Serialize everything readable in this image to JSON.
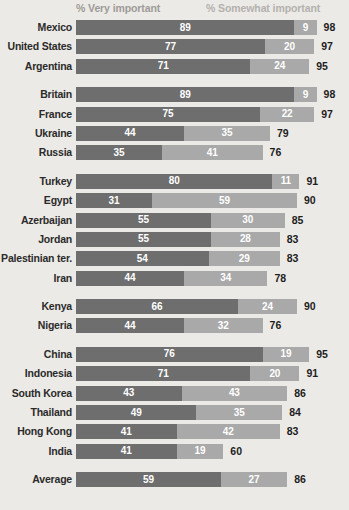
{
  "legend": {
    "very_label": "% Very important",
    "somewhat_label": "% Somewhat important"
  },
  "chart_data": {
    "type": "bar",
    "title": "",
    "subtitle": "",
    "xlabel": "",
    "ylabel": "",
    "orientation": "horizontal",
    "stacked": true,
    "grid": false,
    "legend_position": "top",
    "xlim": [
      0,
      100
    ],
    "categories": [
      "Mexico",
      "United States",
      "Argentina",
      "Britain",
      "France",
      "Ukraine",
      "Russia",
      "Turkey",
      "Egypt",
      "Azerbaijan",
      "Jordan",
      "Palestinian ter.",
      "Iran",
      "Kenya",
      "Nigeria",
      "China",
      "Indonesia",
      "South Korea",
      "Thailand",
      "Hong Kong",
      "India",
      "Average"
    ],
    "series": [
      {
        "name": "% Very important",
        "color": "#6e6e6e",
        "values": [
          89,
          77,
          71,
          89,
          75,
          44,
          35,
          80,
          31,
          55,
          55,
          54,
          44,
          66,
          44,
          76,
          71,
          43,
          49,
          41,
          41,
          59
        ]
      },
      {
        "name": "% Somewhat important",
        "color": "#a9a9a9",
        "values": [
          9,
          20,
          24,
          9,
          22,
          35,
          41,
          11,
          59,
          30,
          28,
          29,
          34,
          24,
          32,
          19,
          20,
          43,
          35,
          42,
          19,
          27
        ]
      }
    ],
    "totals": [
      98,
      97,
      95,
      98,
      97,
      79,
      76,
      91,
      90,
      85,
      83,
      83,
      78,
      90,
      76,
      95,
      91,
      86,
      84,
      83,
      60,
      86
    ],
    "groups": [
      {
        "start": 0,
        "count": 3
      },
      {
        "start": 3,
        "count": 4
      },
      {
        "start": 7,
        "count": 6
      },
      {
        "start": 13,
        "count": 2
      },
      {
        "start": 15,
        "count": 6
      },
      {
        "start": 21,
        "count": 1
      }
    ]
  },
  "colors": {
    "background": "#eceae6",
    "very_important": "#6e6e6e",
    "somewhat_important": "#a9a9a9",
    "label_text": "#2b2b2b",
    "legend_text": "#9d9b98"
  }
}
